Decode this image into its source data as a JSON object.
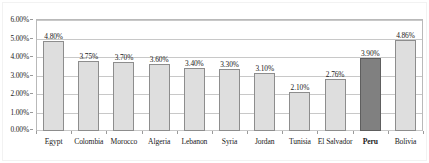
{
  "chart_data": {
    "type": "bar",
    "title": "",
    "subtitle": "",
    "xlabel": "",
    "ylabel": "",
    "ylim": [
      0,
      6
    ],
    "grid": true,
    "legend": "none",
    "y_tick_labels": [
      "0.00%",
      "1.00%",
      "2.00%",
      "3.00%",
      "4.00%",
      "5.00%",
      "6.00%"
    ],
    "y_tick_values": [
      0,
      1,
      2,
      3,
      4,
      5,
      6
    ],
    "categories": [
      "Egypt",
      "Colombia",
      "Morocco",
      "Algeria",
      "Lebanon",
      "Syria",
      "Jordan",
      "Tunisia",
      "El Salvador",
      "Peru",
      "Bolivia"
    ],
    "values": [
      4.8,
      3.75,
      3.7,
      3.6,
      3.4,
      3.3,
      3.1,
      2.1,
      2.76,
      3.9,
      4.86
    ],
    "data_labels": [
      "4.80%",
      "3.75%",
      "3.70%",
      "3.60%",
      "3.40%",
      "3.30%",
      "3.10%",
      "2.10%",
      "2.76%",
      "3.90%",
      "4.86%"
    ],
    "highlight_category": "Peru",
    "highlight_index": 9,
    "colors": {
      "bar_fill": "#dedede",
      "bar_border": "#8d8d8d",
      "highlight_fill": "#808080",
      "highlight_border": "#5e5e5e",
      "gridline": "#c8c8c8",
      "axis": "#b9b9b9",
      "text": "#1a1a1a",
      "background": "#ffffff"
    }
  }
}
